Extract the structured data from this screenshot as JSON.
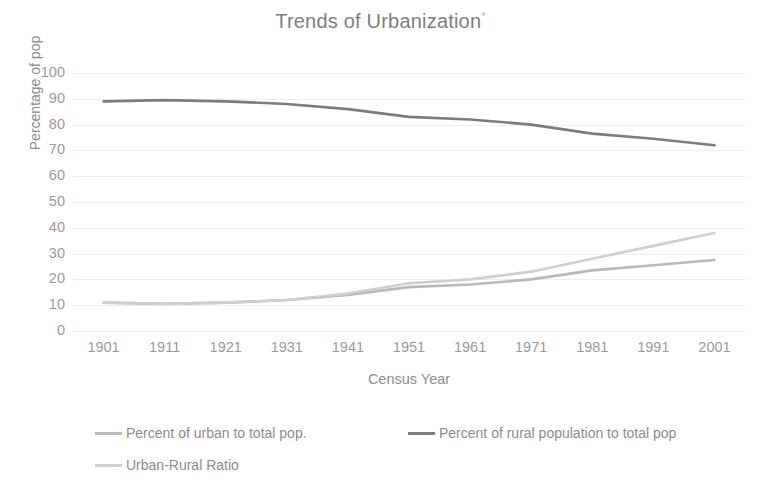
{
  "chart_data": {
    "type": "line",
    "title": "Trends of Urbanization",
    "title_superscript": "*",
    "xlabel": "Census Year",
    "ylabel": "Percentage of pop",
    "categories": [
      "1901",
      "1911",
      "1921",
      "1931",
      "1941",
      "1951",
      "1961",
      "1971",
      "1981",
      "1991",
      "2001"
    ],
    "x": [
      1901,
      1911,
      1921,
      1931,
      1941,
      1951,
      1961,
      1971,
      1981,
      1991,
      2001
    ],
    "ylim": [
      0,
      100
    ],
    "yticks": [
      "0",
      "10",
      "20",
      "30",
      "40",
      "50",
      "60",
      "70",
      "80",
      "90",
      "100"
    ],
    "ytick_values": [
      0,
      10,
      20,
      30,
      40,
      50,
      60,
      70,
      80,
      90,
      100
    ],
    "grid": true,
    "grid_axis": "y",
    "legend_position": "bottom",
    "series": [
      {
        "name": "Percent of urban to total pop.",
        "color": "#b9b9b9",
        "values": [
          11,
          10.5,
          11,
          12,
          14,
          17,
          18,
          20,
          23.5,
          25.5,
          27.5
        ]
      },
      {
        "name": "Percent of rural population to total pop",
        "color": "#7c7c7c",
        "values": [
          89,
          89.5,
          89,
          88,
          86,
          83,
          82,
          80,
          76.5,
          74.5,
          72
        ]
      },
      {
        "name": "Urban-Rural Ratio",
        "color": "#cfcfcf",
        "values": [
          11,
          10.5,
          11,
          12,
          14.5,
          18.5,
          20,
          23,
          28,
          33,
          38
        ]
      }
    ]
  }
}
